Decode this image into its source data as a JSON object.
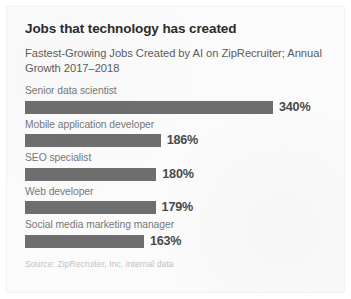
{
  "card": {
    "title": "Jobs that technology has created",
    "subtitle": "Fastest-Growing Jobs Created by AI on ZipRecruiter; Annual Growth 2017–2018",
    "source": "Source: ZipRecruiter, Inc. internal data"
  },
  "colors": {
    "bar": "#6e6e6e",
    "title": "#2b2b2b",
    "subtitle": "#5c5c5c",
    "label": "#777777",
    "value": "#4a4a4a",
    "source": "#c2c2c2",
    "card_background": "#fbfbfb"
  },
  "chart_data": {
    "type": "bar",
    "orientation": "horizontal",
    "title": "Jobs that technology has created",
    "subtitle": "Fastest-Growing Jobs Created by AI on ZipRecruiter; Annual Growth 2017–2018",
    "xlabel": "",
    "ylabel": "",
    "xlim": [
      0,
      340
    ],
    "grid": false,
    "legend": "none",
    "units": "percent",
    "value_suffix": "%",
    "source": "Source: ZipRecruiter, Inc. internal data",
    "categories": [
      "Senior data scientist",
      "Mobile application developer",
      "SEO specialist",
      "Web developer",
      "Social media marketing manager"
    ],
    "values": [
      340,
      186,
      180,
      179,
      163
    ],
    "value_labels": [
      "340%",
      "186%",
      "180%",
      "179%",
      "163%"
    ],
    "bars": [
      {
        "label": "Senior data scientist",
        "value": 340,
        "value_label": "340%"
      },
      {
        "label": "Mobile application developer",
        "value": 186,
        "value_label": "186%"
      },
      {
        "label": "SEO specialist",
        "value": 180,
        "value_label": "180%"
      },
      {
        "label": "Web developer",
        "value": 179,
        "value_label": "179%"
      },
      {
        "label": "Social media marketing manager",
        "value": 163,
        "value_label": "163%"
      }
    ]
  }
}
